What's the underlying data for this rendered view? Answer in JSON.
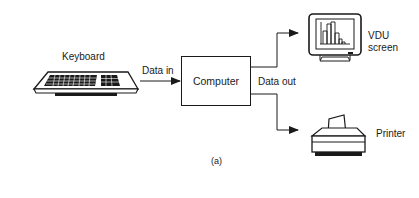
{
  "diagram": {
    "type": "block-diagram",
    "nodes": {
      "keyboard": {
        "label": "Keyboard",
        "icon": "keyboard-icon"
      },
      "computer": {
        "label": "Computer"
      },
      "vdu": {
        "label_line1": "VDU",
        "label_line2": "screen",
        "icon": "monitor-icon"
      },
      "printer": {
        "label": "Printer",
        "icon": "printer-icon"
      }
    },
    "edges": {
      "data_in": {
        "label": "Data in",
        "from": "keyboard",
        "to": "computer"
      },
      "data_out": {
        "label": "Data out",
        "from": "computer",
        "to": [
          "vdu",
          "printer"
        ]
      }
    },
    "caption": "(a)"
  },
  "colors": {
    "ink": "#1a1a1a",
    "background": "#ffffff"
  }
}
